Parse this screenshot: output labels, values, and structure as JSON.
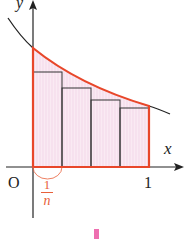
{
  "diagram": {
    "axis_labels": {
      "x": "x",
      "y": "y"
    },
    "origin_label": "O",
    "x_tick_label": "1",
    "width_label": {
      "numerator": "1",
      "denominator": "n"
    },
    "rectangles_count": 4,
    "colors": {
      "curve_upper": "#222222",
      "outline": "#e8472a",
      "fill": "#f7e4f0",
      "axis": "#222222",
      "fraction": "#e8603a",
      "marker": "#ee6fb0"
    }
  }
}
